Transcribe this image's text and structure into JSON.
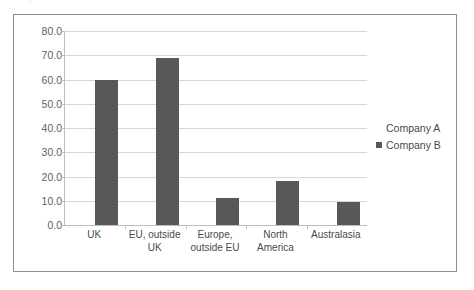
{
  "page": {
    "clipped_header_text": "· · ,   · ·   ·   ·   ·"
  },
  "chart_data": {
    "type": "bar",
    "title": "",
    "xlabel": "",
    "ylabel": "",
    "ylim": [
      0,
      80
    ],
    "ytick_step": 10,
    "ytick_labels": [
      "0.0",
      "10.0",
      "20.0",
      "30.0",
      "40.0",
      "50.0",
      "60.0",
      "70.0",
      "80.0"
    ],
    "grid": true,
    "legend_position": "right",
    "categories": [
      "UK",
      "EU, outside UK",
      "Europe, outside EU",
      "North America",
      "Australasia"
    ],
    "series": [
      {
        "name": "Company A",
        "color": "#ffffff",
        "values": [
          0,
          0,
          0,
          0,
          0
        ]
      },
      {
        "name": "Company B",
        "color": "#58585a",
        "values": [
          60,
          69,
          11,
          18,
          9.5
        ]
      }
    ]
  },
  "legend": {
    "entries": [
      {
        "label": "Company A",
        "marker": "none"
      },
      {
        "label": "Company B",
        "marker": "square"
      }
    ]
  }
}
